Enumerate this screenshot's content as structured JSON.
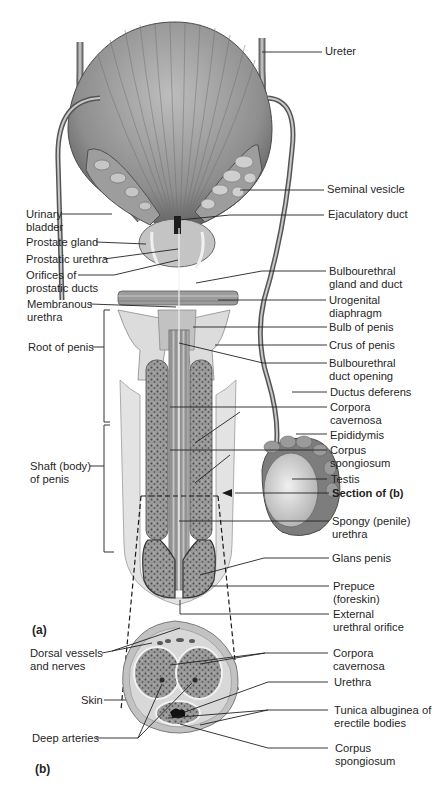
{
  "diagram": {
    "panels": [
      {
        "id": "a",
        "label": "(a)"
      },
      {
        "id": "b",
        "label": "(b)"
      }
    ],
    "panel_a": {
      "right_labels": [
        {
          "text": "Ureter"
        },
        {
          "text": "Seminal vesicle"
        },
        {
          "text": "Ejaculatory duct"
        },
        {
          "text": "Bulbourethral\ngland and duct"
        },
        {
          "text": "Urogenital\ndiaphragm"
        },
        {
          "text": "Bulb of penis"
        },
        {
          "text": "Crus of penis"
        },
        {
          "text": "Bulbourethral\nduct opening"
        },
        {
          "text": "Ductus deferens"
        },
        {
          "text": "Corpora\ncavernosa"
        },
        {
          "text": "Epididymis"
        },
        {
          "text": "Corpus\nspongiosum"
        },
        {
          "text": "Testis"
        },
        {
          "text": "Section of (b)",
          "bold": true
        },
        {
          "text": "Spongy (penile)\nurethra"
        },
        {
          "text": "Glans penis"
        },
        {
          "text": "Prepuce\n(foreskin)"
        },
        {
          "text": "External\nurethral orifice"
        }
      ],
      "left_labels": [
        {
          "text": "Urinary\nbladder"
        },
        {
          "text": "Prostate gland"
        },
        {
          "text": "Prostatic urethra"
        },
        {
          "text": "Orifices of\nprostatic ducts"
        },
        {
          "text": "Membranous\nurethra"
        },
        {
          "text": "Root of penis"
        },
        {
          "text": "Shaft (body)\nof penis"
        }
      ]
    },
    "panel_b": {
      "left_labels": [
        {
          "text": "Dorsal vessels\nand nerves"
        },
        {
          "text": "Skin"
        },
        {
          "text": "Deep arteries"
        }
      ],
      "right_labels": [
        {
          "text": "Corpora\ncavernosa"
        },
        {
          "text": "Urethra"
        },
        {
          "text": "Tunica albuginea of\nerectile bodies"
        },
        {
          "text": "Corpus\nspongiosum"
        }
      ]
    }
  }
}
